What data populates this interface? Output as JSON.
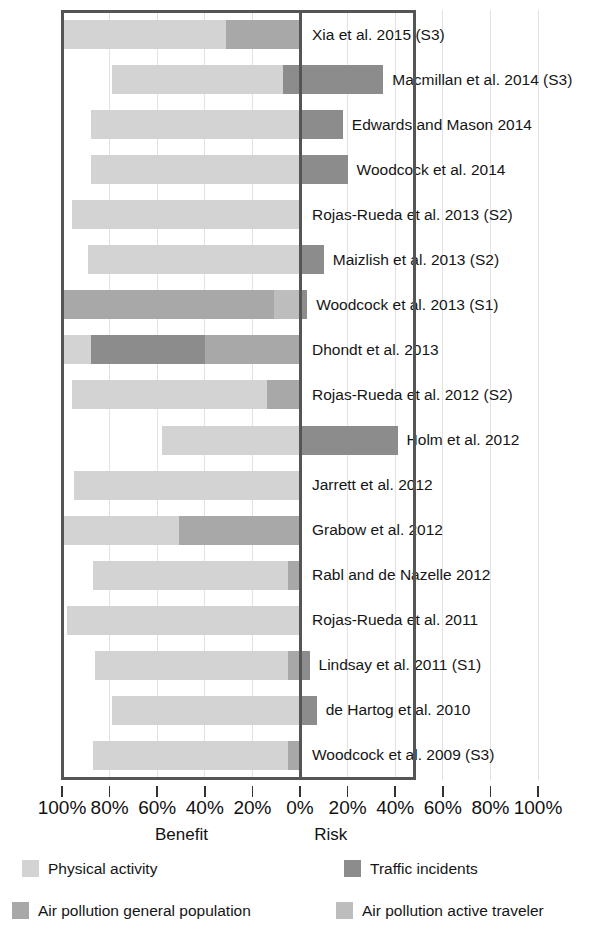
{
  "chart_data": {
    "type": "bar",
    "orientation": "horizontal-diverging",
    "title": "",
    "xlabel": "",
    "ylabel": "",
    "grid": true,
    "legend_position": "bottom",
    "axis": {
      "benefit_label": "Benefit",
      "risk_label": "Risk",
      "tick_labels": [
        "100%",
        "80%",
        "60%",
        "40%",
        "20%",
        "0%",
        "20%",
        "40%",
        "60%",
        "80%",
        "100%"
      ],
      "tick_values": [
        -100,
        -80,
        -60,
        -40,
        -20,
        0,
        20,
        40,
        60,
        80,
        100
      ],
      "xlim": [
        -100,
        100
      ],
      "plot_frame_left_pct": -100,
      "plot_frame_right_pct": 48
    },
    "series": [
      {
        "name": "Physical activity",
        "key": "physical_activity",
        "color": "#d3d3d3"
      },
      {
        "name": "Traffic incidents",
        "key": "traffic_incidents",
        "color": "#8c8c8c"
      },
      {
        "name": "Air pollution general population",
        "key": "air_pollution_general",
        "color": "#a8a8a8"
      },
      {
        "name": "Air pollution active traveler",
        "key": "air_pollution_traveler",
        "color": "#bdbdbd"
      }
    ],
    "categories": [
      "Xia et al. 2015 (S3)",
      "Macmillan et al. 2014 (S3)",
      "Edwards and Mason 2014",
      "Woodcock et al. 2014",
      "Rojas-Rueda et al. 2013 (S2)",
      "Maizlish et al. 2013 (S2)",
      "Woodcock et al. 2013 (S1)",
      "Dhondt et al. 2013",
      "Rojas-Rueda et al. 2012 (S2)",
      "Holm et al. 2012",
      "Jarrett et al. 2012",
      "Grabow et al. 2012",
      "Rabl and de Nazelle 2012",
      "Rojas-Rueda et al. 2011",
      "Lindsay et al. 2011 (S1)",
      "de Hartog et al. 2010",
      "Woodcock et al. 2009 (S3)"
    ],
    "rows": [
      {
        "label": "Xia et al. 2015 (S3)",
        "segments": [
          {
            "series": "physical_activity",
            "from": -100,
            "to": -31
          },
          {
            "series": "air_pollution_general",
            "to": 0,
            "from": -31
          }
        ]
      },
      {
        "label": "Macmillan et al. 2014 (S3)",
        "segments": [
          {
            "series": "physical_activity",
            "from": -79,
            "to": -7
          },
          {
            "series": "traffic_incidents",
            "from": -7,
            "to": 35
          }
        ]
      },
      {
        "label": "Edwards and Mason 2014",
        "segments": [
          {
            "series": "physical_activity",
            "from": -88,
            "to": 0
          },
          {
            "series": "traffic_incidents",
            "from": 0,
            "to": 18
          }
        ]
      },
      {
        "label": "Woodcock et al. 2014",
        "segments": [
          {
            "series": "physical_activity",
            "from": -88,
            "to": 0
          },
          {
            "series": "traffic_incidents",
            "from": 0,
            "to": 20
          }
        ]
      },
      {
        "label": "Rojas-Rueda et al. 2013 (S2)",
        "segments": [
          {
            "series": "physical_activity",
            "from": -96,
            "to": 0
          }
        ]
      },
      {
        "label": "Maizlish et al. 2013 (S2)",
        "segments": [
          {
            "series": "physical_activity",
            "from": -89,
            "to": 0
          },
          {
            "series": "traffic_incidents",
            "from": 0,
            "to": 10
          }
        ]
      },
      {
        "label": "Woodcock et al. 2013 (S1)",
        "segments": [
          {
            "series": "air_pollution_general",
            "from": -100,
            "to": -11
          },
          {
            "series": "air_pollution_traveler",
            "from": -11,
            "to": 0
          },
          {
            "series": "traffic_incidents",
            "from": 0,
            "to": 3
          }
        ]
      },
      {
        "label": "Dhondt et al. 2013",
        "segments": [
          {
            "series": "physical_activity",
            "from": -100,
            "to": -88
          },
          {
            "series": "traffic_incidents",
            "from": -88,
            "to": -40
          },
          {
            "series": "air_pollution_general",
            "from": -40,
            "to": 0
          }
        ]
      },
      {
        "label": "Rojas-Rueda et al. 2012 (S2)",
        "segments": [
          {
            "series": "physical_activity",
            "from": -96,
            "to": -14
          },
          {
            "series": "air_pollution_general",
            "from": -14,
            "to": 0
          }
        ]
      },
      {
        "label": "Holm et al. 2012",
        "segments": [
          {
            "series": "physical_activity",
            "from": -58,
            "to": 0
          },
          {
            "series": "traffic_incidents",
            "from": 0,
            "to": 41
          }
        ]
      },
      {
        "label": "Jarrett et al. 2012",
        "segments": [
          {
            "series": "physical_activity",
            "from": -95,
            "to": 0
          }
        ]
      },
      {
        "label": "Grabow et al. 2012",
        "segments": [
          {
            "series": "physical_activity",
            "from": -100,
            "to": -51
          },
          {
            "series": "air_pollution_general",
            "from": -51,
            "to": 0
          }
        ]
      },
      {
        "label": "Rabl and de Nazelle 2012",
        "segments": [
          {
            "series": "physical_activity",
            "from": -87,
            "to": -5
          },
          {
            "series": "air_pollution_general",
            "from": -5,
            "to": 0
          }
        ]
      },
      {
        "label": "Rojas-Rueda et al. 2011",
        "segments": [
          {
            "series": "physical_activity",
            "from": -98,
            "to": 0
          }
        ]
      },
      {
        "label": "Lindsay et al. 2011 (S1)",
        "segments": [
          {
            "series": "physical_activity",
            "from": -86,
            "to": -5
          },
          {
            "series": "air_pollution_general",
            "from": -5,
            "to": 0
          },
          {
            "series": "traffic_incidents",
            "from": 0,
            "to": 4
          }
        ]
      },
      {
        "label": "de Hartog et al. 2010",
        "segments": [
          {
            "series": "physical_activity",
            "from": -79,
            "to": 0
          },
          {
            "series": "traffic_incidents",
            "from": 0,
            "to": 7
          }
        ]
      },
      {
        "label": "Woodcock et al. 2009 (S3)",
        "segments": [
          {
            "series": "physical_activity",
            "from": -87,
            "to": -5
          },
          {
            "series": "air_pollution_general",
            "from": -5,
            "to": 0
          }
        ]
      }
    ]
  },
  "legend": {
    "entries": [
      {
        "label": "Physical activity",
        "color": "#d3d3d3"
      },
      {
        "label": "Traffic incidents",
        "color": "#8c8c8c"
      },
      {
        "label": "Air pollution general population",
        "color": "#a8a8a8"
      },
      {
        "label": "Air pollution active traveler",
        "color": "#bdbdbd"
      }
    ]
  }
}
